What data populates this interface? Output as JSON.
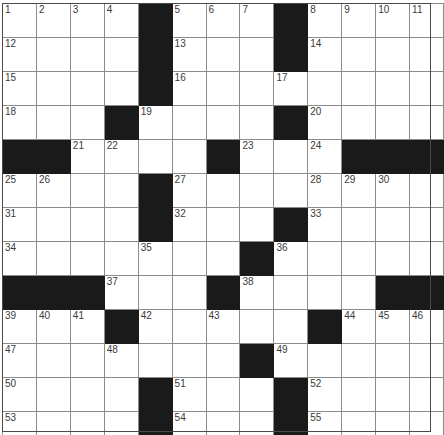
{
  "puzzle": {
    "type": "crossword-grid",
    "rows": 13,
    "cols": 13,
    "cell_size_px": 33,
    "colors": {
      "block": "#1a1a1a",
      "cell": "#ffffff",
      "gridline": "#8c8c8c",
      "border": "#4a4a4a",
      "number_text": "#3a3a3a"
    },
    "max_clue_number": 55,
    "grid": [
      [
        {
          "black": false,
          "number": "1"
        },
        {
          "black": false,
          "number": "2"
        },
        {
          "black": false,
          "number": "3"
        },
        {
          "black": false,
          "number": "4"
        },
        {
          "black": true,
          "number": ""
        },
        {
          "black": false,
          "number": "5"
        },
        {
          "black": false,
          "number": "6"
        },
        {
          "black": false,
          "number": "7"
        },
        {
          "black": true,
          "number": ""
        },
        {
          "black": false,
          "number": "8"
        },
        {
          "black": false,
          "number": "9"
        },
        {
          "black": false,
          "number": "10"
        },
        {
          "black": false,
          "number": "11"
        }
      ],
      [
        {
          "black": false,
          "number": "12"
        },
        {
          "black": false,
          "number": ""
        },
        {
          "black": false,
          "number": ""
        },
        {
          "black": false,
          "number": ""
        },
        {
          "black": true,
          "number": ""
        },
        {
          "black": false,
          "number": "13"
        },
        {
          "black": false,
          "number": ""
        },
        {
          "black": false,
          "number": ""
        },
        {
          "black": true,
          "number": ""
        },
        {
          "black": false,
          "number": "14"
        },
        {
          "black": false,
          "number": ""
        },
        {
          "black": false,
          "number": ""
        },
        {
          "black": false,
          "number": ""
        }
      ],
      [
        {
          "black": false,
          "number": "15"
        },
        {
          "black": false,
          "number": ""
        },
        {
          "black": false,
          "number": ""
        },
        {
          "black": false,
          "number": ""
        },
        {
          "black": true,
          "number": ""
        },
        {
          "black": false,
          "number": "16"
        },
        {
          "black": false,
          "number": ""
        },
        {
          "black": false,
          "number": ""
        },
        {
          "black": false,
          "number": "17"
        },
        {
          "black": false,
          "number": ""
        },
        {
          "black": false,
          "number": ""
        },
        {
          "black": false,
          "number": ""
        },
        {
          "black": false,
          "number": ""
        }
      ],
      [
        {
          "black": false,
          "number": "18"
        },
        {
          "black": false,
          "number": ""
        },
        {
          "black": false,
          "number": ""
        },
        {
          "black": true,
          "number": ""
        },
        {
          "black": false,
          "number": "19"
        },
        {
          "black": false,
          "number": ""
        },
        {
          "black": false,
          "number": ""
        },
        {
          "black": false,
          "number": ""
        },
        {
          "black": true,
          "number": ""
        },
        {
          "black": false,
          "number": "20"
        },
        {
          "black": false,
          "number": ""
        },
        {
          "black": false,
          "number": ""
        },
        {
          "black": false,
          "number": ""
        }
      ],
      [
        {
          "black": true,
          "number": ""
        },
        {
          "black": true,
          "number": ""
        },
        {
          "black": false,
          "number": "21"
        },
        {
          "black": false,
          "number": "22"
        },
        {
          "black": false,
          "number": ""
        },
        {
          "black": false,
          "number": ""
        },
        {
          "black": true,
          "number": ""
        },
        {
          "black": false,
          "number": "23"
        },
        {
          "black": false,
          "number": ""
        },
        {
          "black": false,
          "number": "24"
        },
        {
          "black": true,
          "number": ""
        },
        {
          "black": true,
          "number": ""
        },
        {
          "black": true,
          "number": ""
        }
      ],
      [
        {
          "black": false,
          "number": "25"
        },
        {
          "black": false,
          "number": "26"
        },
        {
          "black": false,
          "number": ""
        },
        {
          "black": false,
          "number": ""
        },
        {
          "black": true,
          "number": ""
        },
        {
          "black": false,
          "number": "27"
        },
        {
          "black": false,
          "number": ""
        },
        {
          "black": false,
          "number": ""
        },
        {
          "black": false,
          "number": ""
        },
        {
          "black": false,
          "number": "28"
        },
        {
          "black": false,
          "number": "29"
        },
        {
          "black": false,
          "number": "30"
        },
        {
          "black": false,
          "number": ""
        }
      ],
      [
        {
          "black": false,
          "number": "31"
        },
        {
          "black": false,
          "number": ""
        },
        {
          "black": false,
          "number": ""
        },
        {
          "black": false,
          "number": ""
        },
        {
          "black": true,
          "number": ""
        },
        {
          "black": false,
          "number": "32"
        },
        {
          "black": false,
          "number": ""
        },
        {
          "black": false,
          "number": ""
        },
        {
          "black": true,
          "number": ""
        },
        {
          "black": false,
          "number": "33"
        },
        {
          "black": false,
          "number": ""
        },
        {
          "black": false,
          "number": ""
        },
        {
          "black": false,
          "number": ""
        }
      ],
      [
        {
          "black": false,
          "number": "34"
        },
        {
          "black": false,
          "number": ""
        },
        {
          "black": false,
          "number": ""
        },
        {
          "black": false,
          "number": ""
        },
        {
          "black": false,
          "number": "35"
        },
        {
          "black": false,
          "number": ""
        },
        {
          "black": false,
          "number": ""
        },
        {
          "black": true,
          "number": ""
        },
        {
          "black": false,
          "number": "36"
        },
        {
          "black": false,
          "number": ""
        },
        {
          "black": false,
          "number": ""
        },
        {
          "black": false,
          "number": ""
        },
        {
          "black": false,
          "number": ""
        }
      ],
      [
        {
          "black": true,
          "number": ""
        },
        {
          "black": true,
          "number": ""
        },
        {
          "black": true,
          "number": ""
        },
        {
          "black": false,
          "number": "37"
        },
        {
          "black": false,
          "number": ""
        },
        {
          "black": false,
          "number": ""
        },
        {
          "black": true,
          "number": ""
        },
        {
          "black": false,
          "number": "38"
        },
        {
          "black": false,
          "number": ""
        },
        {
          "black": false,
          "number": ""
        },
        {
          "black": false,
          "number": ""
        },
        {
          "black": true,
          "number": ""
        },
        {
          "black": true,
          "number": ""
        }
      ],
      [
        {
          "black": false,
          "number": "39"
        },
        {
          "black": false,
          "number": "40"
        },
        {
          "black": false,
          "number": "41"
        },
        {
          "black": true,
          "number": ""
        },
        {
          "black": false,
          "number": "42"
        },
        {
          "black": false,
          "number": ""
        },
        {
          "black": false,
          "number": "43"
        },
        {
          "black": false,
          "number": ""
        },
        {
          "black": false,
          "number": ""
        },
        {
          "black": true,
          "number": ""
        },
        {
          "black": false,
          "number": "44"
        },
        {
          "black": false,
          "number": "45"
        },
        {
          "black": false,
          "number": "46"
        }
      ],
      [
        {
          "black": false,
          "number": "47"
        },
        {
          "black": false,
          "number": ""
        },
        {
          "black": false,
          "number": ""
        },
        {
          "black": false,
          "number": "48"
        },
        {
          "black": false,
          "number": ""
        },
        {
          "black": false,
          "number": ""
        },
        {
          "black": false,
          "number": ""
        },
        {
          "black": true,
          "number": ""
        },
        {
          "black": false,
          "number": "49"
        },
        {
          "black": false,
          "number": ""
        },
        {
          "black": false,
          "number": ""
        },
        {
          "black": false,
          "number": ""
        },
        {
          "black": false,
          "number": ""
        }
      ],
      [
        {
          "black": false,
          "number": "50"
        },
        {
          "black": false,
          "number": ""
        },
        {
          "black": false,
          "number": ""
        },
        {
          "black": false,
          "number": ""
        },
        {
          "black": true,
          "number": ""
        },
        {
          "black": false,
          "number": "51"
        },
        {
          "black": false,
          "number": ""
        },
        {
          "black": false,
          "number": ""
        },
        {
          "black": true,
          "number": ""
        },
        {
          "black": false,
          "number": "52"
        },
        {
          "black": false,
          "number": ""
        },
        {
          "black": false,
          "number": ""
        },
        {
          "black": false,
          "number": ""
        }
      ],
      [
        {
          "black": false,
          "number": "53"
        },
        {
          "black": false,
          "number": ""
        },
        {
          "black": false,
          "number": ""
        },
        {
          "black": false,
          "number": ""
        },
        {
          "black": true,
          "number": ""
        },
        {
          "black": false,
          "number": "54"
        },
        {
          "black": false,
          "number": ""
        },
        {
          "black": false,
          "number": ""
        },
        {
          "black": true,
          "number": ""
        },
        {
          "black": false,
          "number": "55"
        },
        {
          "black": false,
          "number": ""
        },
        {
          "black": false,
          "number": ""
        },
        {
          "black": false,
          "number": ""
        }
      ]
    ]
  }
}
